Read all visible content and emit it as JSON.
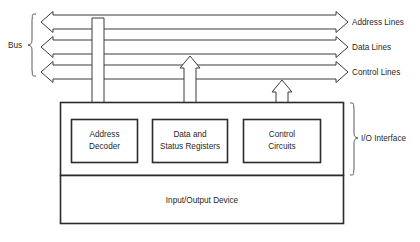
{
  "diagram": {
    "bus": {
      "label": "Bus",
      "lines": [
        {
          "name": "address-lines",
          "label": "Address Lines"
        },
        {
          "name": "data-lines",
          "label": "Data Lines"
        },
        {
          "name": "control-lines",
          "label": "Control Lines"
        }
      ]
    },
    "interface": {
      "label": "I/O Interface",
      "blocks": [
        {
          "name": "address-decoder",
          "line1": "Address",
          "line2": "Decoder"
        },
        {
          "name": "data-status-registers",
          "line1": "Data and",
          "line2": "Status Registers"
        },
        {
          "name": "control-circuits",
          "line1": "Control",
          "line2": "Circuits"
        }
      ]
    },
    "device": {
      "label": "Input/Output Device"
    },
    "connectors": [
      {
        "name": "address-connector",
        "direction": "down"
      },
      {
        "name": "data-connector",
        "direction": "both"
      },
      {
        "name": "control-connector",
        "direction": "both"
      }
    ],
    "colors": {
      "stroke": "#2b2b2b",
      "thin_stroke": "#5a5a5a",
      "background": "#ffffff",
      "text": "#1f1f1f"
    }
  }
}
